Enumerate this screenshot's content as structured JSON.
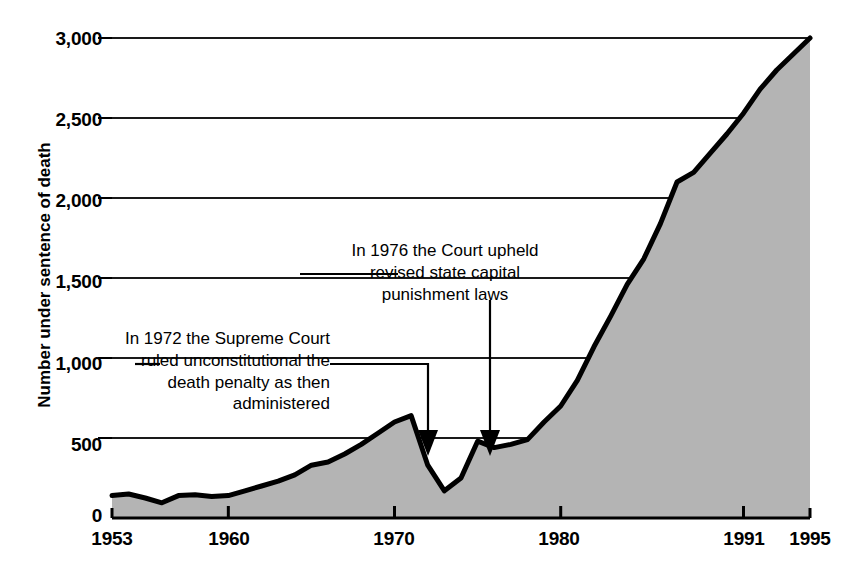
{
  "chart_data": {
    "type": "area",
    "title": "",
    "subtitle": "",
    "xlabel": "",
    "ylabel": "Number under sentence of death",
    "xlim": [
      1953,
      1995
    ],
    "ylim": [
      0,
      3000
    ],
    "grid": true,
    "legend": null,
    "x_tick_labels": [
      "1953",
      "1960",
      "1970",
      "1980",
      "1991",
      "1995"
    ],
    "x_tick_values": [
      1953,
      1960,
      1970,
      1980,
      1991,
      1995
    ],
    "y_tick_labels": [
      "0",
      "500",
      "1,000",
      "1,500",
      "2,000",
      "2,500",
      "3,000"
    ],
    "y_tick_values": [
      0,
      500,
      1000,
      1500,
      2000,
      2500,
      3000
    ],
    "series": [
      {
        "name": "Number under sentence of death",
        "x": [
          1953,
          1954,
          1955,
          1956,
          1957,
          1958,
          1959,
          1960,
          1961,
          1962,
          1963,
          1964,
          1965,
          1966,
          1967,
          1968,
          1969,
          1970,
          1971,
          1972,
          1973,
          1974,
          1975,
          1976,
          1977,
          1978,
          1979,
          1980,
          1981,
          1982,
          1983,
          1984,
          1985,
          1986,
          1987,
          1988,
          1989,
          1990,
          1991,
          1992,
          1993,
          1994,
          1995
        ],
        "values": [
          140,
          150,
          125,
          95,
          140,
          145,
          135,
          140,
          170,
          200,
          230,
          270,
          330,
          350,
          400,
          460,
          530,
          600,
          640,
          330,
          170,
          250,
          480,
          440,
          460,
          490,
          600,
          700,
          860,
          1070,
          1260,
          1460,
          1620,
          1840,
          2100,
          2160,
          2280,
          2400,
          2530,
          2680,
          2800,
          2900,
          3000
        ]
      }
    ],
    "annotations": [
      {
        "id": "1972-ruling",
        "text": "In 1972 the Supreme Court\nruled unconstitutional the\ndeath penalty as then\nadministered",
        "points_to_year": 1972,
        "points_to_value": 500
      },
      {
        "id": "1976-ruling",
        "text": "In 1976 the Court upheld\nrevised state capital\npunishment laws",
        "points_to_year": 1976,
        "points_to_value": 500
      }
    ],
    "colors": {
      "area_fill": "#b4b4b4",
      "line": "#000000",
      "grid": "#1a1a1a",
      "axis": "#000000",
      "text": "#000000",
      "background": "#ffffff"
    }
  }
}
